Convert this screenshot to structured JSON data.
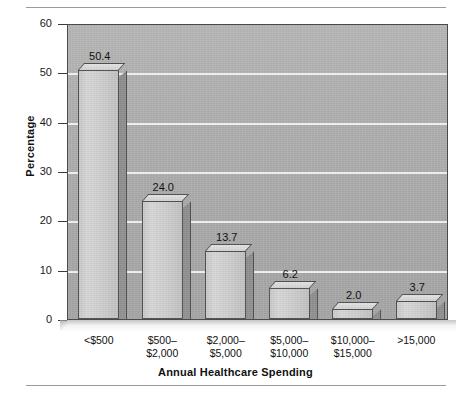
{
  "chart_data": {
    "type": "bar",
    "title": "",
    "xlabel": "Annual Healthcare Spending",
    "ylabel": "Percentage",
    "categories": [
      "<$500",
      "$500–\n$2,000",
      "$2,000–\n$5,000",
      "$5,000–\n$10,000",
      "$10,000–\n$15,000",
      ">15,000"
    ],
    "values": [
      50.4,
      24.0,
      13.7,
      6.2,
      2.0,
      3.7
    ],
    "value_labels": [
      "50.4",
      "24.0",
      "13.7",
      "6.2",
      "2.0",
      "3.7"
    ],
    "ylim": [
      0,
      60
    ],
    "yticks": [
      0,
      10,
      20,
      30,
      40,
      50,
      60
    ],
    "ytick_labels": [
      "0",
      "10",
      "20",
      "30",
      "40",
      "50",
      "60"
    ],
    "grid": "horizontal",
    "legend": "none",
    "colors": {
      "bar_face": "#d2d2d2",
      "bar_side": "#909090",
      "bar_outline": "#4f4f4f",
      "plot_background": "#ababab",
      "gridline": "#f2f2f2",
      "text": "#111111",
      "rule": "#9a9a9a"
    }
  }
}
